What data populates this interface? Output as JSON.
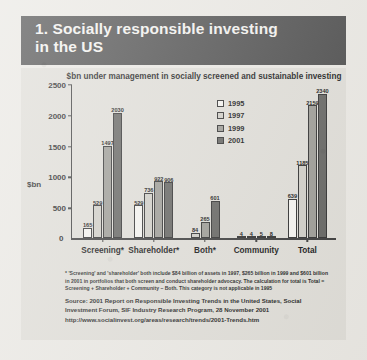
{
  "header": {
    "number": "1.",
    "title_line1": "1. Socially responsible investing",
    "title_line2": "in the US"
  },
  "chart_data": {
    "type": "bar",
    "title": "$bn under management in socially screened and sustainable investing",
    "xlabel": "",
    "ylabel": "$bn",
    "ylim": [
      0,
      2500
    ],
    "yticks": [
      "0",
      "500",
      "1000",
      "1500",
      "2000",
      "2500"
    ],
    "grid": false,
    "legend_position": "inside-top-right",
    "categories": [
      "Screening*",
      "Shareholder*",
      "Both*",
      "Community",
      "Total"
    ],
    "series": [
      {
        "name": "1995",
        "color": "#f4f3ef",
        "values": [
          165,
          529,
          null,
          4,
          639
        ],
        "labels": [
          "165",
          "529",
          "",
          "4",
          "639"
        ]
      },
      {
        "name": "1997",
        "color": "#cfcdc6",
        "values": [
          529,
          736,
          84,
          4,
          1185
        ],
        "labels": [
          "529",
          "736",
          "84",
          "4",
          "1185"
        ]
      },
      {
        "name": "1999",
        "color": "#9b9a94",
        "values": [
          1497,
          922,
          265,
          5,
          2159
        ],
        "labels": [
          "1497",
          "922",
          "265",
          "5",
          "2159"
        ]
      },
      {
        "name": "2001",
        "color": "#636360",
        "values": [
          2030,
          906,
          601,
          8,
          2340
        ],
        "labels": [
          "2030",
          "906",
          "601",
          "8",
          "2340"
        ]
      }
    ]
  },
  "footnote": "* 'Screening' and 'shareholder' both include $84 billion of assets in 1997, $265 billion in 1999 and $601 billion in 2001 in portfolios that both screen and conduct shareholder advocacy. The calculation for total is Total = Screening + Shareholder + Community – Both. This category is not applicable in 1995",
  "source": {
    "text": "Source: 2001 Report on Responsible Investing Trends in the United States, Social Investment Forum, SIF Industry Research Program, 28 November 2001",
    "url": "http://www.socialinvest.org/areas/research/trends/2001-Trends.htm"
  }
}
